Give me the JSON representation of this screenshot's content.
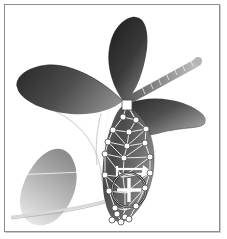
{
  "app": {
    "title": "3D Viewport",
    "background_color": "#ffffff",
    "frame_color": "#8e8e8e"
  },
  "viewport": {
    "name": "perspective-viewport",
    "width": 216,
    "height": 228,
    "render_mode": "shaded-grayscale"
  },
  "model": {
    "name": "orchid-flower-model",
    "description": "Grayscale shaded orchid flower with petals, seed pod and stem",
    "parts": [
      {
        "name": "upper-left-petal",
        "fill_dark": "#3a3a3a",
        "fill_light": "#8d8d8d"
      },
      {
        "name": "upper-center-petal",
        "fill_dark": "#2f2f2f",
        "fill_light": "#7d7d7d"
      },
      {
        "name": "right-petal",
        "fill_dark": "#343434",
        "fill_light": "#8a8a8a"
      },
      {
        "name": "center-pod",
        "fill_dark": "#3d3d3d",
        "fill_light": "#9a9a9a"
      },
      {
        "name": "lower-left-petal",
        "fill_dark": "#9c9c9c",
        "fill_light": "#e8e8e8"
      },
      {
        "name": "striped-antenna",
        "fill_dark": "#4a4a4a",
        "fill_light": "#bdbdbd"
      },
      {
        "name": "stem-curves",
        "stroke": "#f2f2f2"
      }
    ]
  },
  "deformer": {
    "name": "lattice-deformation-cage",
    "line_color": "#f0f0f0",
    "point_color": "#ffffff",
    "point_stroke": "#4b4b4b",
    "point_count": 22,
    "rows": 6,
    "columns": 4
  },
  "handles": {
    "anchor_square": {
      "name": "pivot-anchor-handle",
      "shape": "square",
      "color": "#ffffff",
      "x": 122,
      "y": 100
    },
    "control_points": [
      {
        "x": 118,
        "y": 112
      },
      {
        "x": 131,
        "y": 115
      },
      {
        "x": 108,
        "y": 125
      },
      {
        "x": 124,
        "y": 127
      },
      {
        "x": 141,
        "y": 124
      },
      {
        "x": 103,
        "y": 137
      },
      {
        "x": 122,
        "y": 141
      },
      {
        "x": 140,
        "y": 138
      },
      {
        "x": 100,
        "y": 149
      },
      {
        "x": 119,
        "y": 153
      },
      {
        "x": 145,
        "y": 152
      },
      {
        "x": 100,
        "y": 170
      },
      {
        "x": 145,
        "y": 168
      },
      {
        "x": 104,
        "y": 186
      },
      {
        "x": 140,
        "y": 183
      },
      {
        "x": 110,
        "y": 203
      },
      {
        "x": 131,
        "y": 201
      },
      {
        "x": 112,
        "y": 209
      },
      {
        "x": 120,
        "y": 212
      },
      {
        "x": 107,
        "y": 215
      },
      {
        "x": 116,
        "y": 217
      },
      {
        "x": 124,
        "y": 214
      }
    ]
  },
  "gizmo": {
    "name": "transform-gizmo",
    "type": "move-rotate",
    "center_x": 124,
    "center_y": 185,
    "radius": 17,
    "cross_color": "#ffffff",
    "ring_color": "#1f1f1f",
    "label": "Move / Rotate"
  },
  "direction_widget": {
    "name": "direction-arrow-widget",
    "type": "arrow",
    "color": "#ffffff",
    "start_x": 112,
    "start_y": 165,
    "end_x": 144,
    "end_y": 167,
    "label": "Axis direction"
  },
  "status": {
    "selection": "Lattice",
    "tool": "Move"
  }
}
